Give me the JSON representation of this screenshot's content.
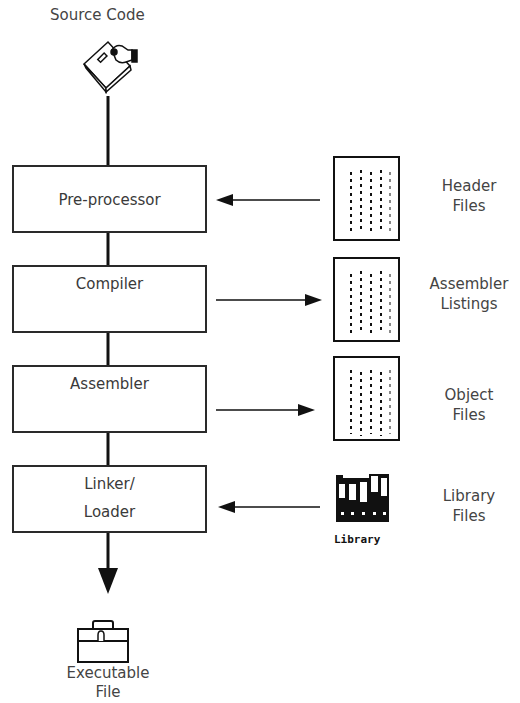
{
  "diagram": {
    "source": {
      "label": "Source Code",
      "icon": "floppy-disk-hand-icon"
    },
    "stages": [
      {
        "id": "preprocessor",
        "line1": "Pre-processor",
        "line2": ""
      },
      {
        "id": "compiler",
        "line1": "Compiler",
        "line2": ""
      },
      {
        "id": "assembler",
        "line1": "Assembler",
        "line2": ""
      },
      {
        "id": "linker",
        "line1": "Linker/",
        "line2": "Loader"
      }
    ],
    "side_items": [
      {
        "id": "header",
        "line1": "Header",
        "line2": "Files",
        "direction": "in",
        "icon": "document-icon"
      },
      {
        "id": "listings",
        "line1": "Assembler",
        "line2": "Listings",
        "direction": "out",
        "icon": "document-icon"
      },
      {
        "id": "object",
        "line1": "Object",
        "line2": "Files",
        "direction": "out",
        "icon": "document-icon"
      },
      {
        "id": "library",
        "line1": "Library",
        "line2": "Files",
        "direction": "in",
        "icon": "library-binders-icon",
        "icon_caption": "Library"
      }
    ],
    "output": {
      "line1": "Executable",
      "line2": "File",
      "icon": "toolbox-icon"
    }
  }
}
